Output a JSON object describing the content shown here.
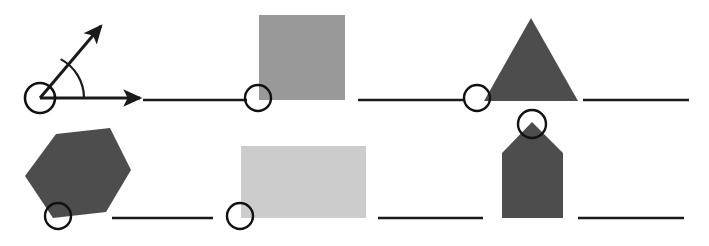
{
  "canvas": {
    "width": 709,
    "height": 246,
    "background": "#ffffff",
    "title": "Geometric shapes and angle figure worksheet"
  },
  "palette": {
    "stroke": "#1a1a1a",
    "medium_gray": "#999999",
    "dark_gray": "#4d4d4d",
    "light_gray": "#cccccc",
    "circle_stroke": "#111111",
    "background": "#ffffff"
  },
  "rows": [
    {
      "name": "top-row",
      "baseline_y": 100,
      "items": [
        {
          "kind": "angle",
          "name": "angle-figure",
          "vertex": [
            40,
            98
          ],
          "circle_radius": 15,
          "horizontal_ray_end": [
            140,
            98
          ],
          "diagonal_ray_end": [
            101,
            26
          ],
          "arc_radius": 44,
          "arc_degrees": 62,
          "fill": "none",
          "stroke": "#1a1a1a",
          "stroke_width": 3
        },
        {
          "kind": "line",
          "name": "segment-top-1",
          "x1": 143,
          "y1": 100,
          "x2": 247,
          "y2": 100,
          "stroke": "#1a1a1a",
          "stroke_width": 2.4
        },
        {
          "kind": "square",
          "name": "square-shape",
          "x": 259,
          "y": 15,
          "width": 86,
          "height": 85,
          "fill": "#999999",
          "marker_center": [
            258,
            98
          ],
          "marker_radius": 13
        },
        {
          "kind": "line",
          "name": "segment-top-2",
          "x1": 358,
          "y1": 100,
          "x2": 463,
          "y2": 100,
          "stroke": "#1a1a1a",
          "stroke_width": 2.4
        },
        {
          "kind": "triangle",
          "name": "triangle-shape",
          "points": "531,18 578,101 484,101",
          "fill": "#4d4d4d",
          "marker_center": [
            477,
            98
          ],
          "marker_radius": 13
        },
        {
          "kind": "line",
          "name": "segment-top-3",
          "x1": 583,
          "y1": 100,
          "x2": 689,
          "y2": 100,
          "stroke": "#1a1a1a",
          "stroke_width": 2.4
        }
      ]
    },
    {
      "name": "bottom-row",
      "baseline_y": 218,
      "items": [
        {
          "kind": "hexagon",
          "name": "hexagon-shape",
          "points": "56,134 110,128 131,170 106,212 53,218 25,176",
          "fill": "#4d4d4d",
          "marker_center": [
            58,
            216
          ],
          "marker_radius": 13
        },
        {
          "kind": "line",
          "name": "segment-bottom-1",
          "x1": 112,
          "y1": 218,
          "x2": 213,
          "y2": 218,
          "stroke": "#1a1a1a",
          "stroke_width": 2.4
        },
        {
          "kind": "rectangle",
          "name": "rectangle-shape",
          "x": 241,
          "y": 146,
          "width": 125,
          "height": 72,
          "fill": "#cccccc",
          "marker_center": [
            240,
            216
          ],
          "marker_radius": 13
        },
        {
          "kind": "line",
          "name": "segment-bottom-2",
          "x1": 378,
          "y1": 218,
          "x2": 483,
          "y2": 218,
          "stroke": "#1a1a1a",
          "stroke_width": 2.4
        },
        {
          "kind": "pentagon",
          "name": "pentagon-shape",
          "points": "532,122 563,153 563,218 502,218 502,153",
          "fill": "#4d4d4d",
          "marker_center": [
            532,
            124
          ],
          "marker_radius": 14
        },
        {
          "kind": "line",
          "name": "segment-bottom-3",
          "x1": 578,
          "y1": 218,
          "x2": 684,
          "y2": 218,
          "stroke": "#1a1a1a",
          "stroke_width": 2.4
        }
      ]
    }
  ]
}
